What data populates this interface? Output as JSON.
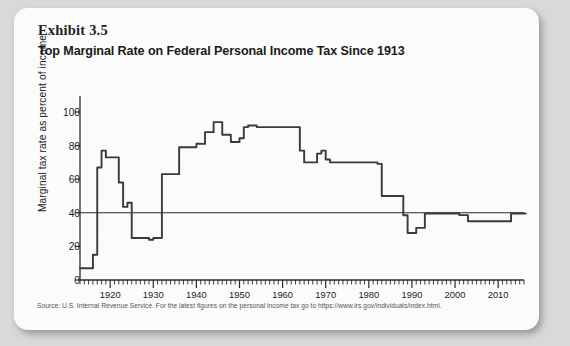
{
  "exhibit": {
    "number": "Exhibit 3.5",
    "title": "Top Marginal Rate on Federal Personal Income Tax Since 1913"
  },
  "source": {
    "text": "Source: U.S. Internal Revenue Service. For the latest figures on the personal income tax go to https://www.irs.gov/individuals/index.html."
  },
  "colors": {
    "card_background": "#fbfbfb",
    "page_background": "#d9d9d9",
    "line": "#3a3a3a",
    "axis": "#2b2b2b",
    "text": "#1c1c1c",
    "source_text": "#555252"
  },
  "chart_data": {
    "type": "line",
    "title": "Top Marginal Rate on Federal Personal Income Tax Since 1913",
    "xlabel": "",
    "ylabel": "Marginal tax rate as percent of income",
    "xlim": [
      1913,
      2016
    ],
    "ylim": [
      0,
      110
    ],
    "yticks": [
      0,
      20,
      40,
      60,
      80,
      100
    ],
    "ytick_labels": [
      "0",
      "20",
      "40",
      "60",
      "80",
      "100"
    ],
    "xticks": [
      1920,
      1930,
      1940,
      1950,
      1960,
      1970,
      1980,
      1990,
      2000,
      2010
    ],
    "xtick_labels": [
      "1920",
      "1930",
      "1940",
      "1950",
      "1960",
      "1970",
      "1980",
      "1990",
      "2000",
      "2010"
    ],
    "x_minor_tick_interval": 1,
    "grid": false,
    "legend": false,
    "reference_lines": [
      {
        "orientation": "horizontal",
        "value": 40,
        "label": "40 percent reference line"
      }
    ],
    "series": [
      {
        "name": "Top marginal federal personal income tax rate",
        "units": "percent",
        "x": [
          1913,
          1914,
          1915,
          1916,
          1917,
          1918,
          1919,
          1920,
          1921,
          1922,
          1923,
          1924,
          1925,
          1926,
          1927,
          1928,
          1929,
          1930,
          1931,
          1932,
          1933,
          1934,
          1935,
          1936,
          1937,
          1938,
          1939,
          1940,
          1941,
          1942,
          1943,
          1944,
          1945,
          1946,
          1947,
          1948,
          1949,
          1950,
          1951,
          1952,
          1953,
          1954,
          1955,
          1956,
          1957,
          1958,
          1959,
          1960,
          1961,
          1962,
          1963,
          1964,
          1965,
          1966,
          1967,
          1968,
          1969,
          1970,
          1971,
          1972,
          1973,
          1974,
          1975,
          1976,
          1977,
          1978,
          1979,
          1980,
          1981,
          1982,
          1983,
          1984,
          1985,
          1986,
          1987,
          1988,
          1989,
          1990,
          1991,
          1992,
          1993,
          1994,
          1995,
          1996,
          1997,
          1998,
          1999,
          2000,
          2001,
          2002,
          2003,
          2004,
          2005,
          2006,
          2007,
          2008,
          2009,
          2010,
          2011,
          2012,
          2013,
          2014,
          2015
        ],
        "y": [
          7,
          7,
          7,
          15,
          67,
          77,
          73,
          73,
          73,
          58,
          43.5,
          46,
          25,
          25,
          25,
          25,
          24,
          25,
          25,
          63,
          63,
          63,
          63,
          79,
          79,
          79,
          79,
          81.1,
          81,
          88,
          88,
          94,
          94,
          86.45,
          86.45,
          82.13,
          82.13,
          84.36,
          91,
          92,
          92,
          91,
          91,
          91,
          91,
          91,
          91,
          91,
          91,
          91,
          91,
          77,
          70,
          70,
          70,
          75.25,
          77,
          71.75,
          70,
          70,
          70,
          70,
          70,
          70,
          70,
          70,
          70,
          70,
          70,
          69.125,
          50,
          50,
          50,
          50,
          50,
          38.5,
          28,
          28,
          31,
          31,
          39.6,
          39.6,
          39.6,
          39.6,
          39.6,
          39.6,
          39.6,
          39.6,
          38.6,
          38.6,
          35,
          35,
          35,
          35,
          35,
          35,
          35,
          35,
          35,
          35,
          39.6,
          39.6,
          39.6
        ]
      }
    ],
    "annotations": []
  }
}
